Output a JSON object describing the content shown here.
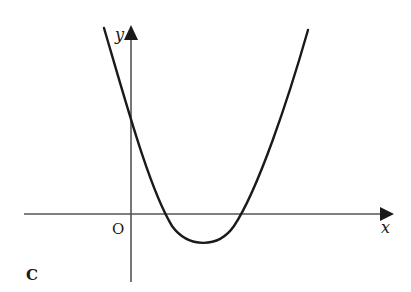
{
  "figure": {
    "panel_label": "C",
    "origin_label": "O",
    "x_axis_label": "x",
    "y_axis_label": "y"
  },
  "colors": {
    "axis": "#555555",
    "curve": "#1a1a1a",
    "background": "#ffffff"
  },
  "geometry": {
    "axis_origin_px": [
      131,
      214
    ],
    "x_axis_px": {
      "x_start": 24,
      "x_end": 388
    },
    "y_axis_px": {
      "y_bottom": 282,
      "y_top": 27
    },
    "curve_px": {
      "left_end": [
        104,
        28
      ],
      "x_intercepts": [
        166,
        241
      ],
      "vertex": [
        204,
        243
      ],
      "right_end": [
        308,
        30
      ]
    }
  }
}
